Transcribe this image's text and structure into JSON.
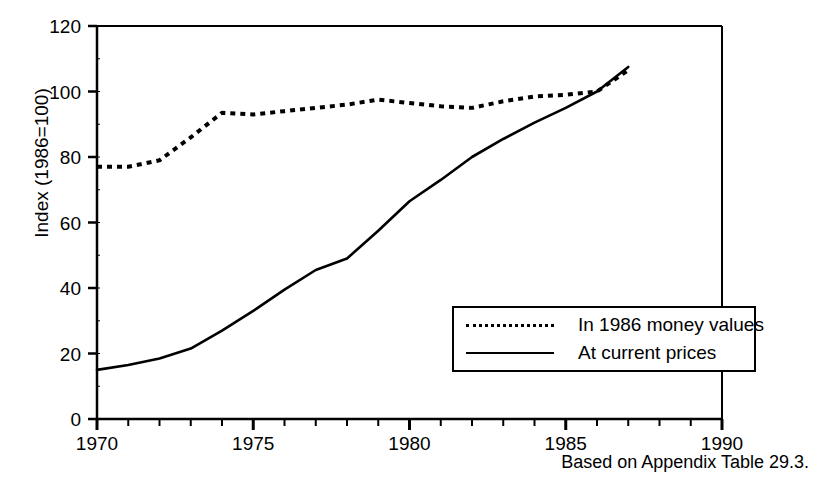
{
  "figure": {
    "top_caption": "",
    "source_note": "Based on Appendix Table 29.3."
  },
  "chart_data": {
    "type": "line",
    "title": "",
    "xlabel": "",
    "ylabel": "Index (1986=100)",
    "xlim": [
      1970,
      1990
    ],
    "ylim": [
      0,
      120
    ],
    "yticks": [
      0,
      20,
      40,
      60,
      80,
      100,
      120
    ],
    "xticks": [
      1970,
      1975,
      1980,
      1985,
      1990
    ],
    "xtick_labels": [
      "1970",
      "1975",
      "1980",
      "1985",
      "1990"
    ],
    "ytick_labels": [
      "0",
      "20",
      "40",
      "60",
      "80",
      "100",
      "120"
    ],
    "minor_xtick_interval": 1,
    "grid": false,
    "legend_position": "lower-right",
    "x": [
      1970,
      1971,
      1972,
      1973,
      1974,
      1975,
      1976,
      1977,
      1978,
      1979,
      1980,
      1981,
      1982,
      1983,
      1984,
      1985,
      1986,
      1987
    ],
    "series": [
      {
        "name": "In 1986 money values",
        "style": "dotted",
        "color": "#000000",
        "values": [
          77,
          77,
          79,
          86,
          93.5,
          93,
          94,
          95,
          96,
          97.5,
          96.5,
          95.5,
          95,
          97,
          98.5,
          99,
          100,
          106.5
        ]
      },
      {
        "name": "At current prices",
        "style": "solid",
        "color": "#000000",
        "values": [
          15,
          16.5,
          18.5,
          21.5,
          27,
          33,
          39.5,
          45.5,
          49,
          57.5,
          66.5,
          73,
          80,
          85.5,
          90.5,
          95,
          100,
          107.5
        ]
      }
    ]
  },
  "legend": {
    "entries": [
      {
        "label": "In 1986 money values",
        "style": "dotted"
      },
      {
        "label": "At current prices",
        "style": "solid"
      }
    ]
  }
}
